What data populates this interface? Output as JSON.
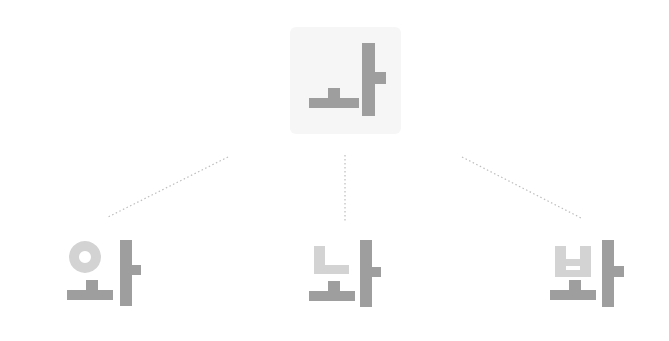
{
  "diagram": {
    "root": {
      "glyph": "ㅏ",
      "label": "ㅏ",
      "color": "#9e9e9e",
      "highlight_bg": "#f6f6f6"
    },
    "children": [
      {
        "glyph": "와",
        "initial": "ㅇ",
        "medial": "ㅗ+ㅏ",
        "initial_color": "#d3d3d3",
        "base_color": "#9e9e9e"
      },
      {
        "glyph": "놔",
        "initial": "ㄴ",
        "medial": "ㅗ+ㅏ",
        "initial_color": "#d3d3d3",
        "base_color": "#9e9e9e"
      },
      {
        "glyph": "봐",
        "initial": "ㅂ",
        "medial": "ㅗ+ㅏ",
        "initial_color": "#d3d3d3",
        "base_color": "#9e9e9e"
      }
    ],
    "connector_color": "#bdbdbd"
  }
}
